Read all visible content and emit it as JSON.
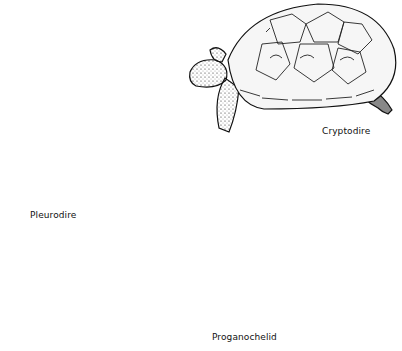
{
  "figure": {
    "turtles": [
      {
        "name": "cryptodire",
        "label": "Cryptodire"
      },
      {
        "name": "pleurodire",
        "label": "Pleurodire"
      },
      {
        "name": "proganochelid",
        "label": "Proganochelid"
      }
    ]
  },
  "colors": {
    "ink": "#111111",
    "background": "#ffffff",
    "shell_light": "#f2f2f2"
  }
}
